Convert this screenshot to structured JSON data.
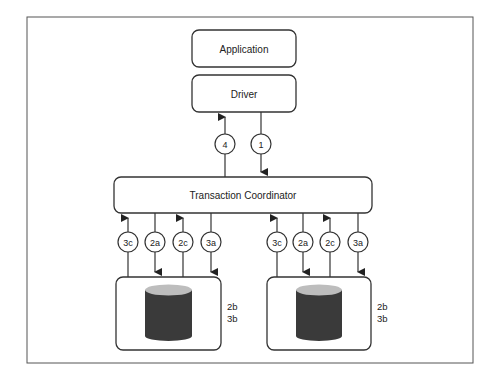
{
  "diagram": {
    "boxes": {
      "application": "Application",
      "driver": "Driver",
      "coordinator": "Transaction Coordinator"
    },
    "driver_arrows": [
      {
        "label": "4",
        "direction": "up"
      },
      {
        "label": "1",
        "direction": "down"
      }
    ],
    "left_db": {
      "arrows": [
        {
          "label": "3c",
          "direction": "up"
        },
        {
          "label": "2a",
          "direction": "down"
        },
        {
          "label": "2c",
          "direction": "up"
        },
        {
          "label": "3a",
          "direction": "down"
        }
      ],
      "side_labels": [
        "2b",
        "3b"
      ]
    },
    "right_db": {
      "arrows": [
        {
          "label": "3c",
          "direction": "up"
        },
        {
          "label": "2a",
          "direction": "down"
        },
        {
          "label": "2c",
          "direction": "up"
        },
        {
          "label": "3a",
          "direction": "down"
        }
      ],
      "side_labels": [
        "2b",
        "3b"
      ]
    },
    "colors": {
      "stroke": "#333333",
      "cylinder_body": "#3a3a3a",
      "cylinder_top": "#bdbdbd",
      "frame": "#555555"
    }
  }
}
